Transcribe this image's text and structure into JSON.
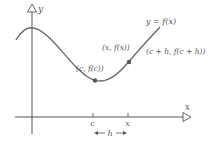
{
  "diagram": {
    "axes": {
      "y_label": "y",
      "x_label": "x"
    },
    "curve_label": "y = f(x)",
    "points": [
      {
        "label": "(c, f(c))"
      },
      {
        "label": "(x, f(x))"
      }
    ],
    "secant_label": "(c + h, f(c + h))",
    "ticks": [
      {
        "label": "c"
      },
      {
        "label": "x"
      }
    ],
    "interval_label": "h",
    "colors": {
      "curve": "#6a6a6a",
      "axis": "#555555",
      "point": "#555555",
      "text": "#555555"
    }
  }
}
